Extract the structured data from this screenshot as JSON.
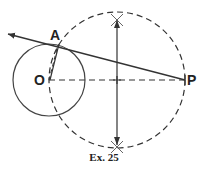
{
  "figure": {
    "caption": "Ex. 25",
    "points": {
      "O": "O",
      "A": "A",
      "P": "P"
    }
  },
  "colors": {
    "stroke": "#333333",
    "background": "#ffffff"
  }
}
